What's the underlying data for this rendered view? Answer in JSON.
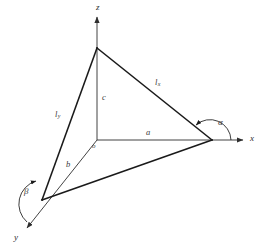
{
  "figure": {
    "type": "geometry-diagram",
    "background_color": "#ffffff",
    "line_color_thick": "#1a1a1a",
    "line_color_thin": "#707070",
    "text_color": "#3a3a3a"
  },
  "axes": [
    {
      "id": "z",
      "label": "z",
      "direction": "up",
      "label_x": 96,
      "label_y": 3
    },
    {
      "id": "x",
      "label": "x",
      "direction": "right",
      "label_x": 250,
      "label_y": 134
    },
    {
      "id": "y",
      "label": "y",
      "direction": "down-left",
      "label_x": 14,
      "label_y": 233
    }
  ],
  "origin": {
    "label": "o",
    "label_x": 92,
    "label_y": 143,
    "point_x": 97,
    "point_y": 140
  },
  "intercepts": [
    {
      "id": "a",
      "label": "a",
      "axis": "x",
      "label_x": 146,
      "label_y": 128,
      "point_x": 212,
      "point_y": 140
    },
    {
      "id": "b",
      "label": "b",
      "axis": "y",
      "label_x": 66,
      "label_y": 160,
      "point_x": 42,
      "point_y": 200
    },
    {
      "id": "c",
      "label": "c",
      "axis": "z",
      "label_x": 102,
      "label_y": 93,
      "point_x": 97,
      "point_y": 48
    }
  ],
  "edges": [
    {
      "id": "lx",
      "label": "l",
      "subscript": "x",
      "label_x": 155,
      "label_y": 78,
      "from": "c",
      "to": "a"
    },
    {
      "id": "ly",
      "label": "l",
      "subscript": "y",
      "label_x": 55,
      "label_y": 110,
      "from": "c",
      "to": "b"
    },
    {
      "id": "ab",
      "label": "",
      "subscript": "",
      "from": "a",
      "to": "b"
    }
  ],
  "angles": [
    {
      "id": "alpha",
      "label": "α",
      "label_x": 218,
      "label_y": 118,
      "at_vertex": "a"
    },
    {
      "id": "beta",
      "label": "β",
      "label_x": 24,
      "label_y": 187,
      "at_vertex": "b"
    }
  ]
}
